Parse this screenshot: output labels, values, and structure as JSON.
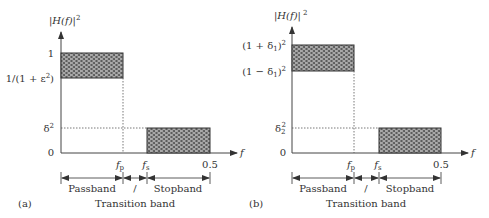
{
  "panels": [
    {
      "id": "a",
      "caption": "(a)",
      "y_axis_label": {
        "main": "|H(f)|",
        "sup": "2"
      },
      "x_axis_label": "f",
      "y_ticks": [
        {
          "label": "1"
        },
        {
          "label": "1/(1 + ε",
          "sup": "2",
          "tail": ")"
        },
        {
          "label": "δ",
          "sup": "2"
        },
        {
          "label": "0"
        }
      ],
      "x_ticks": [
        {
          "label": "f",
          "sub": "p"
        },
        {
          "label": "f",
          "sub": "s"
        },
        {
          "label": "0.5"
        }
      ],
      "bands": {
        "passband": "Passband",
        "transition_mark": "/",
        "stopband": "Stopband",
        "transition": "Transition band"
      }
    },
    {
      "id": "b",
      "caption": "(b)",
      "y_axis_label": {
        "main": "|H(f)|",
        "sup": "2"
      },
      "x_axis_label": "f",
      "y_ticks": [
        {
          "label": "(1 + δ",
          "sub": "1",
          "tail": ")",
          "sup": "2"
        },
        {
          "label": "(1 − δ",
          "sub": "1",
          "tail": ")",
          "sup": "2"
        },
        {
          "label": "δ",
          "sub": "2",
          "sup": "2"
        },
        {
          "label": "0"
        }
      ],
      "x_ticks": [
        {
          "label": "f",
          "sub": "p"
        },
        {
          "label": "f",
          "sub": "s"
        },
        {
          "label": "0.5"
        }
      ],
      "bands": {
        "passband": "Passband",
        "transition_mark": "/",
        "stopband": "Stopband",
        "transition": "Transition band"
      }
    }
  ],
  "colors": {
    "axis": "#444444",
    "text": "#333333",
    "fill_pattern": "#8a8a8a"
  }
}
